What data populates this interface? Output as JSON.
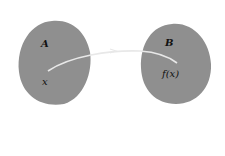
{
  "diagram": {
    "type": "function-mapping",
    "sets": [
      {
        "name": "A",
        "element": "x",
        "color": "#8f8f8f"
      },
      {
        "name": "B",
        "element": "f(x)",
        "color": "#8f8f8f"
      }
    ],
    "arrow": {
      "from": "x",
      "to": "f(x)",
      "color": "#e6e6e6"
    }
  }
}
